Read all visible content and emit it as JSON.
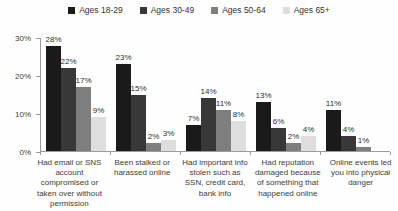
{
  "chart_data": {
    "type": "bar",
    "title": "",
    "categories": [
      "Had email or SNS account compromised or taken over without permission",
      "Been stalked or harassed online",
      "Had important info stolen such as SSN, credit card, bank info",
      "Had reputation damaged because of something that happened online",
      "Online events led you into physical danger"
    ],
    "series": [
      {
        "name": "Ages 18-29",
        "color": "#1a1a1a",
        "values": [
          28,
          23,
          7,
          13,
          11
        ]
      },
      {
        "name": "Ages 30-49",
        "color": "#383838",
        "values": [
          22,
          15,
          14,
          6,
          4
        ]
      },
      {
        "name": "Ages 50-64",
        "color": "#7e7e7e",
        "values": [
          17,
          2,
          11,
          2,
          1
        ]
      },
      {
        "name": "Ages 65+",
        "color": "#dedede",
        "values": [
          9,
          3,
          8,
          4,
          0
        ]
      }
    ],
    "xlabel": "",
    "ylabel": "",
    "ylim": [
      0,
      30
    ],
    "y_ticks": [
      "30%",
      "20%",
      "10%",
      "0%"
    ],
    "value_suffix": "%",
    "legend_position": "top",
    "grid": false,
    "axis_color": "#9b9b9b"
  }
}
